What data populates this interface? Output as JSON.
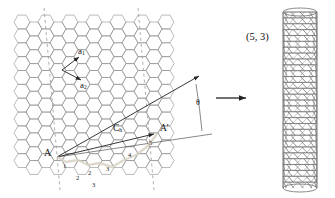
{
  "figure": {
    "background": "#ffffff",
    "lattice_color": "#8d8d8d",
    "vector_color": "#222222",
    "tube_color": "#6e6e6e",
    "text_color": "#111111"
  },
  "labels": {
    "a1": "a",
    "a1_sub": "1",
    "a2": "a",
    "a2_sub": "2",
    "ch": "C",
    "ch_sub": "h",
    "origin": "A",
    "endpoint": "A'",
    "theta": "θ",
    "chirality": "(5, 3)"
  },
  "chart_data": {
    "type": "diagram",
    "chiral_index_n": 5,
    "chiral_index_m": 3,
    "chiral_angle_label": "θ",
    "a1_step_numbers": [
      "1",
      "2",
      "3",
      "4",
      "5"
    ],
    "a2_step_numbers": [
      "1",
      "2",
      "3"
    ],
    "vectors": [
      {
        "name": "a1",
        "label": "a1",
        "role": "lattice-basis-vector"
      },
      {
        "name": "a2",
        "label": "a2",
        "role": "lattice-basis-vector"
      },
      {
        "name": "Ch",
        "label": "Ch",
        "role": "chiral-vector",
        "from": "A",
        "to": "A'"
      },
      {
        "name": "T",
        "label": "",
        "role": "translation-vector"
      }
    ],
    "result_tube": {
      "label": "(5, 3)",
      "orientation": "vertical"
    }
  }
}
